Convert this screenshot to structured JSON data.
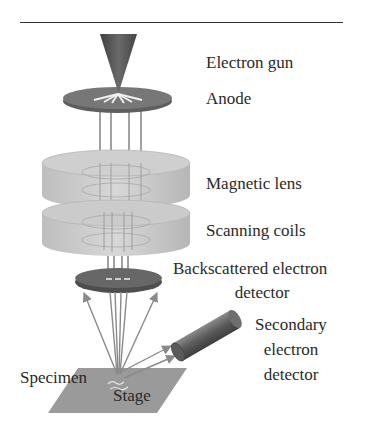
{
  "diagram": {
    "labels": {
      "electron_gun": "Electron gun",
      "anode": "Anode",
      "magnetic_lens": "Magnetic lens",
      "scanning_coils": "Scanning coils",
      "backscattered_line1": "Backscattered electron",
      "backscattered_line2": "detector",
      "secondary_line1": "Secondary",
      "secondary_line2": "electron",
      "secondary_line3": "detector",
      "specimen": "Specimen",
      "stage": "Stage"
    },
    "components": [
      {
        "id": "electron-gun",
        "shape": "cone",
        "color": "#555555"
      },
      {
        "id": "anode",
        "shape": "disk",
        "color": "#6f6f6f"
      },
      {
        "id": "magnetic-lens",
        "shape": "translucent-cylinder",
        "color": "#c4c4c4"
      },
      {
        "id": "scanning-coils",
        "shape": "translucent-cylinder",
        "color": "#c4c4c4"
      },
      {
        "id": "backscattered-electron-detector",
        "shape": "disk",
        "color": "#5e5e5e"
      },
      {
        "id": "secondary-electron-detector",
        "shape": "cylinder",
        "color": "#6a6a6a"
      },
      {
        "id": "stage",
        "shape": "parallelogram",
        "color": "#9a9a9a"
      }
    ],
    "colors": {
      "rule": "#333333",
      "beam": "#8a8a8a",
      "text": "#2a2a2a"
    }
  }
}
